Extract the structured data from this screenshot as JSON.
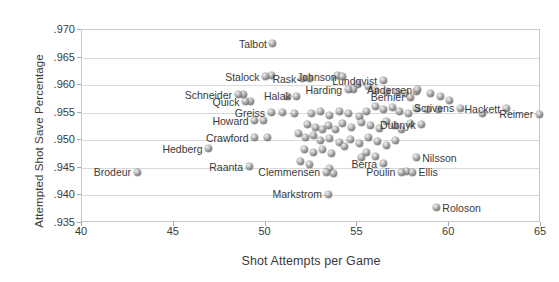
{
  "chart_data": {
    "type": "scatter",
    "title": "",
    "xlabel": "Shot Attempts per Game",
    "ylabel": "Attempted Shot Save Percentage",
    "xlim": [
      40,
      65
    ],
    "ylim": [
      0.935,
      0.97
    ],
    "xticks": [
      "40",
      "45",
      "50",
      "55",
      "60",
      "65"
    ],
    "yticks": [
      ".970",
      ".965",
      ".960",
      ".955",
      ".950",
      ".945",
      ".940",
      ".935"
    ],
    "grid": "horizontal",
    "legend": "none",
    "marker_style": "gray-sphere",
    "labeled_points": [
      {
        "name": "Talbot",
        "x": 50.4,
        "y": 0.9675,
        "side": "left"
      },
      {
        "name": "Stalock",
        "x": 50.0,
        "y": 0.9615,
        "side": "left"
      },
      {
        "name": "Rask",
        "x": 52.0,
        "y": 0.9612,
        "side": "left"
      },
      {
        "name": "Johnson",
        "x": 54.2,
        "y": 0.9615,
        "side": "left"
      },
      {
        "name": "Lundqvist",
        "x": 56.4,
        "y": 0.9608,
        "side": "left"
      },
      {
        "name": "Andersen",
        "x": 58.3,
        "y": 0.9592,
        "side": "left"
      },
      {
        "name": "Hackett",
        "x": 63.1,
        "y": 0.9557,
        "side": "left"
      },
      {
        "name": "Schneider",
        "x": 48.5,
        "y": 0.9583,
        "side": "left"
      },
      {
        "name": "Quick",
        "x": 48.9,
        "y": 0.957,
        "side": "left"
      },
      {
        "name": "Halak",
        "x": 51.7,
        "y": 0.958,
        "side": "left"
      },
      {
        "name": "Harding",
        "x": 54.5,
        "y": 0.9592,
        "side": "left"
      },
      {
        "name": "Bernier",
        "x": 57.9,
        "y": 0.9578,
        "side": "left"
      },
      {
        "name": "Scrivens",
        "x": 60.6,
        "y": 0.9558,
        "side": "left"
      },
      {
        "name": "Greiss",
        "x": 50.3,
        "y": 0.955,
        "side": "left"
      },
      {
        "name": "Howard",
        "x": 49.4,
        "y": 0.9535,
        "side": "left"
      },
      {
        "name": "Crawford",
        "x": 49.4,
        "y": 0.9505,
        "side": "left"
      },
      {
        "name": "Dubnyk",
        "x": 58.5,
        "y": 0.9528,
        "side": "left"
      },
      {
        "name": "Reimer",
        "x": 64.9,
        "y": 0.9547,
        "side": "left"
      },
      {
        "name": "Hedberg",
        "x": 46.9,
        "y": 0.9485,
        "side": "left"
      },
      {
        "name": "Raanta",
        "x": 49.1,
        "y": 0.9452,
        "side": "left"
      },
      {
        "name": "Brodeur",
        "x": 43.0,
        "y": 0.9442,
        "side": "left"
      },
      {
        "name": "Clemmensen",
        "x": 53.3,
        "y": 0.9442,
        "side": "left"
      },
      {
        "name": "Markstrom",
        "x": 53.4,
        "y": 0.9402,
        "side": "left"
      },
      {
        "name": "Berra",
        "x": 56.4,
        "y": 0.9457,
        "side": "left"
      },
      {
        "name": "Poulin",
        "x": 57.4,
        "y": 0.9442,
        "side": "left"
      },
      {
        "name": "Ellis",
        "x": 58.0,
        "y": 0.9442,
        "side": "right"
      },
      {
        "name": "Nilsson",
        "x": 58.2,
        "y": 0.9468,
        "side": "right"
      },
      {
        "name": "Roloson",
        "x": 59.3,
        "y": 0.9378,
        "side": "right"
      }
    ],
    "unlabeled_points": [
      {
        "x": 50.3,
        "y": 0.9618
      },
      {
        "x": 52.4,
        "y": 0.9612
      },
      {
        "x": 53.9,
        "y": 0.9618
      },
      {
        "x": 55.0,
        "y": 0.9602
      },
      {
        "x": 55.6,
        "y": 0.9597
      },
      {
        "x": 56.0,
        "y": 0.959
      },
      {
        "x": 56.6,
        "y": 0.9589
      },
      {
        "x": 57.2,
        "y": 0.9587
      },
      {
        "x": 57.6,
        "y": 0.9585
      },
      {
        "x": 58.2,
        "y": 0.9588
      },
      {
        "x": 48.8,
        "y": 0.9583
      },
      {
        "x": 49.2,
        "y": 0.957
      },
      {
        "x": 51.2,
        "y": 0.958
      },
      {
        "x": 54.8,
        "y": 0.9593
      },
      {
        "x": 59.0,
        "y": 0.9585
      },
      {
        "x": 59.5,
        "y": 0.958
      },
      {
        "x": 60.0,
        "y": 0.9572
      },
      {
        "x": 50.9,
        "y": 0.955
      },
      {
        "x": 51.6,
        "y": 0.9548
      },
      {
        "x": 52.5,
        "y": 0.9549
      },
      {
        "x": 53.0,
        "y": 0.9553
      },
      {
        "x": 53.5,
        "y": 0.9545
      },
      {
        "x": 54.0,
        "y": 0.9552
      },
      {
        "x": 54.5,
        "y": 0.9548
      },
      {
        "x": 55.1,
        "y": 0.9543
      },
      {
        "x": 55.5,
        "y": 0.9553
      },
      {
        "x": 56.0,
        "y": 0.9562
      },
      {
        "x": 56.4,
        "y": 0.9556
      },
      {
        "x": 56.9,
        "y": 0.956
      },
      {
        "x": 57.3,
        "y": 0.9552
      },
      {
        "x": 57.8,
        "y": 0.9549
      },
      {
        "x": 58.2,
        "y": 0.9558
      },
      {
        "x": 58.8,
        "y": 0.9555
      },
      {
        "x": 59.4,
        "y": 0.9556
      },
      {
        "x": 61.8,
        "y": 0.9548
      },
      {
        "x": 49.9,
        "y": 0.9535
      },
      {
        "x": 50.1,
        "y": 0.9505
      },
      {
        "x": 52.3,
        "y": 0.9528
      },
      {
        "x": 52.7,
        "y": 0.9524
      },
      {
        "x": 53.1,
        "y": 0.952
      },
      {
        "x": 53.4,
        "y": 0.9527
      },
      {
        "x": 53.8,
        "y": 0.9519
      },
      {
        "x": 54.2,
        "y": 0.953
      },
      {
        "x": 54.7,
        "y": 0.9523
      },
      {
        "x": 55.2,
        "y": 0.9533
      },
      {
        "x": 55.7,
        "y": 0.9527
      },
      {
        "x": 56.2,
        "y": 0.9521
      },
      {
        "x": 56.6,
        "y": 0.9534
      },
      {
        "x": 57.0,
        "y": 0.9526
      },
      {
        "x": 57.4,
        "y": 0.9519
      },
      {
        "x": 57.9,
        "y": 0.9531
      },
      {
        "x": 51.8,
        "y": 0.9512
      },
      {
        "x": 52.2,
        "y": 0.9505
      },
      {
        "x": 52.6,
        "y": 0.9509
      },
      {
        "x": 53.0,
        "y": 0.9499
      },
      {
        "x": 53.5,
        "y": 0.9504
      },
      {
        "x": 54.0,
        "y": 0.9496
      },
      {
        "x": 54.6,
        "y": 0.9502
      },
      {
        "x": 55.1,
        "y": 0.9494
      },
      {
        "x": 55.6,
        "y": 0.9505
      },
      {
        "x": 56.1,
        "y": 0.9498
      },
      {
        "x": 56.6,
        "y": 0.9491
      },
      {
        "x": 57.1,
        "y": 0.95
      },
      {
        "x": 52.1,
        "y": 0.9483
      },
      {
        "x": 52.6,
        "y": 0.9478
      },
      {
        "x": 53.1,
        "y": 0.9484
      },
      {
        "x": 53.6,
        "y": 0.9476
      },
      {
        "x": 54.3,
        "y": 0.9488
      },
      {
        "x": 55.5,
        "y": 0.9478
      },
      {
        "x": 56.0,
        "y": 0.9471
      },
      {
        "x": 51.9,
        "y": 0.9462
      },
      {
        "x": 52.4,
        "y": 0.9456
      },
      {
        "x": 53.5,
        "y": 0.9448
      },
      {
        "x": 53.7,
        "y": 0.944
      },
      {
        "x": 55.2,
        "y": 0.9468
      },
      {
        "x": 57.7,
        "y": 0.9443
      }
    ]
  }
}
